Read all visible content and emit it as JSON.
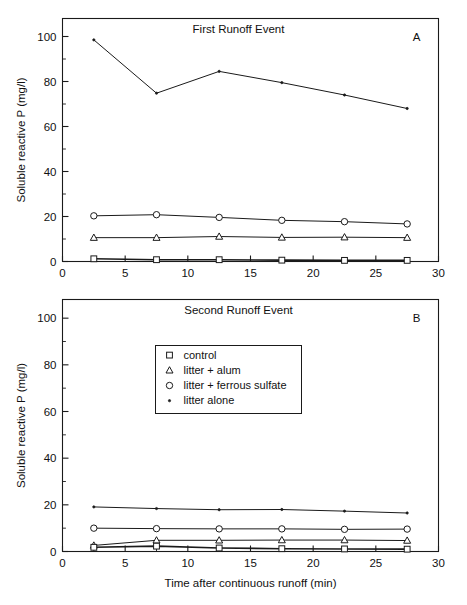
{
  "figure": {
    "background": "#ffffff",
    "ink": "#1a1a1a",
    "xlabel": "Time after continuous runoff (min)",
    "ylabel": "Soluble reactive P (mg/l)"
  },
  "legend": {
    "position": "panel-b-upper-left",
    "entries": [
      {
        "marker": "square-open",
        "label": "control"
      },
      {
        "marker": "triangle-open",
        "label": "litter + alum"
      },
      {
        "marker": "circle-open",
        "label": "litter + ferrous sulfate"
      },
      {
        "marker": "dot-small",
        "label": "litter alone"
      }
    ]
  },
  "axis": {
    "x_ticks": [
      "0",
      "5",
      "10",
      "15",
      "20",
      "25",
      "30"
    ],
    "y_ticks": [
      "0",
      "20",
      "40",
      "60",
      "80",
      "100"
    ]
  },
  "panels": [
    {
      "letter": "A",
      "title": "First Runoff Event"
    },
    {
      "letter": "B",
      "title": "Second Runoff Event"
    }
  ],
  "chart_data": [
    {
      "type": "line",
      "panel": "A",
      "title": "First Runoff Event",
      "xlabel": "Time after continuous runoff (min)",
      "ylabel": "Soluble reactive P (mg/l)",
      "xlim": [
        0,
        30
      ],
      "ylim": [
        0,
        108
      ],
      "xticks": [
        0,
        5,
        10,
        15,
        20,
        25,
        30
      ],
      "yticks": [
        0,
        20,
        40,
        60,
        80,
        100
      ],
      "grid": false,
      "legend": "none",
      "x": [
        2.5,
        7.5,
        12.5,
        17.5,
        22.5,
        27.5
      ],
      "series": [
        {
          "name": "litter alone",
          "marker": "dot-small",
          "values": [
            98.5,
            74.8,
            84.5,
            79.5,
            74.0,
            68.0
          ]
        },
        {
          "name": "litter + ferrous sulfate",
          "marker": "circle-open",
          "values": [
            20.3,
            20.8,
            19.6,
            18.3,
            17.7,
            16.7
          ]
        },
        {
          "name": "litter + alum",
          "marker": "triangle-open",
          "values": [
            10.6,
            10.6,
            11.1,
            10.7,
            10.8,
            10.6
          ]
        },
        {
          "name": "control",
          "marker": "square-open",
          "values": [
            1.2,
            0.8,
            0.8,
            0.6,
            0.5,
            0.5
          ]
        }
      ]
    },
    {
      "type": "line",
      "panel": "B",
      "title": "Second Runoff Event",
      "xlabel": "Time after continuous runoff (min)",
      "ylabel": "Soluble reactive P (mg/l)",
      "xlim": [
        0,
        30
      ],
      "ylim": [
        0,
        108
      ],
      "xticks": [
        0,
        5,
        10,
        15,
        20,
        25,
        30
      ],
      "yticks": [
        0,
        20,
        40,
        60,
        80,
        100
      ],
      "grid": false,
      "legend": "upper-left-inside",
      "x": [
        2.5,
        7.5,
        12.5,
        17.5,
        22.5,
        27.5
      ],
      "series": [
        {
          "name": "litter alone",
          "marker": "dot-small",
          "values": [
            19.1,
            18.4,
            17.9,
            18.0,
            17.3,
            16.5
          ]
        },
        {
          "name": "litter + ferrous sulfate",
          "marker": "circle-open",
          "values": [
            10.0,
            9.8,
            9.7,
            9.7,
            9.5,
            9.6
          ]
        },
        {
          "name": "litter + alum",
          "marker": "triangle-open",
          "values": [
            2.6,
            4.8,
            4.8,
            4.9,
            4.9,
            4.7
          ]
        },
        {
          "name": "control",
          "marker": "square-open",
          "values": [
            1.8,
            2.3,
            1.5,
            1.2,
            1.1,
            1.0
          ]
        }
      ]
    }
  ]
}
